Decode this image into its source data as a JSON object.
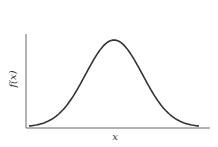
{
  "chart_data": {
    "type": "line",
    "title": "",
    "xlabel": "x",
    "ylabel": "f(x)",
    "grid": false,
    "legend": null,
    "x": [
      -3.0,
      -2.5,
      -2.0,
      -1.5,
      -1.0,
      -0.5,
      0.0,
      0.5,
      1.0,
      1.5,
      2.0,
      2.5,
      3.0
    ],
    "series": [
      {
        "name": "f(x)",
        "values": [
          0.011,
          0.044,
          0.135,
          0.325,
          0.607,
          0.882,
          1.0,
          0.882,
          0.607,
          0.325,
          0.135,
          0.044,
          0.011
        ]
      }
    ],
    "xlim": [
      -3.2,
      3.8
    ],
    "ylim": [
      0,
      1.05
    ],
    "colors": {
      "curve": "#333333",
      "axes": "#666666"
    }
  }
}
